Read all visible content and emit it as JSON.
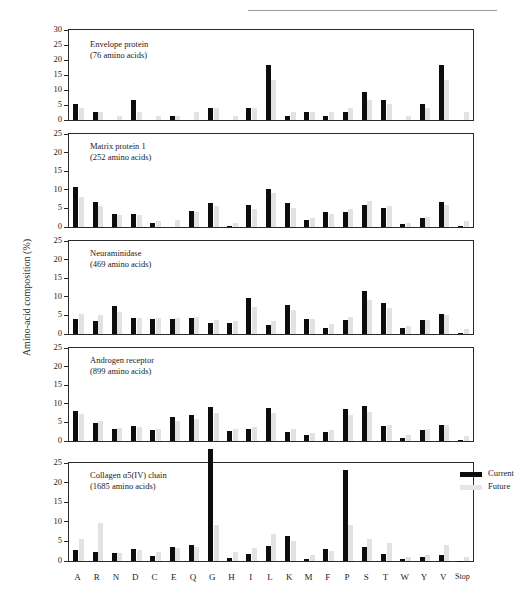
{
  "page": {
    "running_head": "",
    "background": "#ffffff"
  },
  "axis": {
    "ylabel": "Amino-acid composition (%)",
    "ytick_labels_tall": [
      "0",
      "5",
      "10",
      "15",
      "20",
      "25",
      "30"
    ],
    "ytick_labels": [
      "0",
      "5",
      "10",
      "15",
      "20",
      "25"
    ],
    "categories": [
      "A",
      "R",
      "N",
      "D",
      "C",
      "E",
      "Q",
      "G",
      "H",
      "I",
      "L",
      "K",
      "M",
      "F",
      "P",
      "S",
      "T",
      "W",
      "Y",
      "V",
      "Stop"
    ]
  },
  "legend": {
    "position": "top-right-of-bottom-panel",
    "entries": [
      {
        "label": "Current",
        "color": "#0d0d0d"
      },
      {
        "label": "Future",
        "color": "#e6e6e6"
      }
    ]
  },
  "colors": {
    "current": "#0d0d0d",
    "future": "#e2e2e2",
    "axis": "#2a2a2a",
    "text": "#1c1c1c"
  },
  "chart_data": {
    "type": "bar",
    "xlabel": "",
    "ylabel": "Amino-acid composition (%)",
    "categories": [
      "A",
      "R",
      "N",
      "D",
      "C",
      "E",
      "Q",
      "G",
      "H",
      "I",
      "L",
      "K",
      "M",
      "F",
      "P",
      "S",
      "T",
      "W",
      "Y",
      "V",
      "Stop"
    ],
    "legend": [
      "Current",
      "Future"
    ],
    "panels": [
      {
        "name": "Envelope protein",
        "subtitle": "(76 amino acids)",
        "title_line1": "Envelope protein",
        "title_line2": "(76 amino acids)",
        "ylim": [
          0,
          30
        ],
        "yticks": [
          0,
          5,
          10,
          15,
          20,
          25,
          30
        ],
        "series": [
          {
            "name": "Current",
            "values": [
              5.3,
              2.6,
              0.0,
              6.6,
              0.0,
              1.3,
              0.0,
              3.9,
              0.0,
              3.9,
              18.4,
              1.3,
              2.6,
              1.3,
              2.6,
              9.2,
              6.6,
              0.0,
              5.3,
              18.4,
              0.0
            ]
          },
          {
            "name": "Future",
            "values": [
              3.9,
              2.6,
              1.3,
              2.6,
              1.3,
              1.3,
              2.6,
              3.9,
              1.3,
              3.9,
              13.2,
              2.6,
              2.6,
              2.6,
              3.9,
              6.6,
              5.3,
              1.3,
              3.9,
              13.2,
              2.6
            ]
          }
        ]
      },
      {
        "name": "Matrix protein 1",
        "subtitle": "(252 amino acids)",
        "title_line1": "Matrix protein 1",
        "title_line2": "(252 amino acids)",
        "ylim": [
          0,
          25
        ],
        "yticks": [
          0,
          5,
          10,
          15,
          20,
          25
        ],
        "series": [
          {
            "name": "Current",
            "values": [
              10.7,
              6.6,
              3.6,
              3.6,
              1.2,
              0.0,
              4.4,
              6.4,
              0.4,
              5.9,
              10.3,
              6.4,
              2.0,
              4.0,
              4.0,
              6.0,
              5.2,
              0.8,
              2.4,
              6.8,
              0.4
            ]
          },
          {
            "name": "Future",
            "values": [
              8.0,
              5.6,
              3.2,
              3.2,
              1.6,
              2.0,
              4.0,
              5.6,
              1.2,
              4.8,
              9.1,
              5.2,
              2.4,
              3.6,
              4.8,
              7.1,
              5.6,
              1.2,
              2.8,
              6.0,
              1.6
            ]
          }
        ]
      },
      {
        "name": "Neuraminidase",
        "subtitle": "(469 amino acids)",
        "title_line1": "Neuraminidase",
        "title_line2": "(469 amino acids)",
        "ylim": [
          0,
          25
        ],
        "yticks": [
          0,
          5,
          10,
          15,
          20,
          25
        ],
        "series": [
          {
            "name": "Current",
            "values": [
              4.1,
              3.4,
              7.5,
              4.3,
              4.1,
              4.1,
              4.3,
              3.0,
              2.9,
              9.6,
              2.3,
              7.9,
              4.0,
              1.7,
              3.8,
              11.5,
              8.3,
              1.5,
              3.8,
              5.5,
              0.2
            ]
          },
          {
            "name": "Future",
            "values": [
              5.5,
              5.1,
              5.8,
              4.3,
              4.3,
              4.3,
              4.5,
              3.8,
              3.4,
              7.2,
              3.4,
              6.4,
              4.1,
              2.6,
              4.5,
              9.2,
              7.0,
              2.1,
              3.8,
              5.1,
              1.3
            ]
          }
        ]
      },
      {
        "name": "Androgen receptor",
        "subtitle": "(899 amino acids)",
        "title_line1": "Androgen receptor",
        "title_line2": "(899 amino acids)",
        "ylim": [
          0,
          25
        ],
        "yticks": [
          0,
          5,
          10,
          15,
          20,
          25
        ],
        "series": [
          {
            "name": "Current",
            "values": [
              8.0,
              4.9,
              3.1,
              4.0,
              3.0,
              6.4,
              6.9,
              9.1,
              2.8,
              3.3,
              9.0,
              2.5,
              1.6,
              2.3,
              8.7,
              9.4,
              4.0,
              0.8,
              3.0,
              4.3,
              0.2
            ]
          },
          {
            "name": "Future",
            "values": [
              7.2,
              5.3,
              3.5,
              3.8,
              3.2,
              5.4,
              5.9,
              7.6,
              3.3,
              3.8,
              7.6,
              3.2,
              2.1,
              3.0,
              7.0,
              7.8,
              4.4,
              1.6,
              3.3,
              4.3,
              1.3
            ]
          }
        ]
      },
      {
        "name": "Collagen α5(IV) chain",
        "subtitle": "(1685 amino acids)",
        "title_line1": "Collagen α5(IV) chain",
        "title_line2": "(1685 amino acids)",
        "ylim": [
          0,
          25
        ],
        "yticks": [
          0,
          5,
          10,
          15,
          20,
          25
        ],
        "series": [
          {
            "name": "Current",
            "values": [
              2.7,
              2.3,
              2.0,
              3.1,
              1.2,
              3.5,
              4.2,
              28.6,
              0.8,
              1.8,
              3.9,
              6.4,
              0.6,
              3.0,
              23.1,
              3.5,
              1.9,
              0.5,
              0.9,
              1.5,
              0.1
            ]
          },
          {
            "name": "Future",
            "values": [
              5.6,
              9.8,
              2.1,
              2.8,
              2.4,
              3.2,
              3.6,
              9.3,
              2.2,
              3.4,
              6.9,
              5.0,
              1.5,
              2.6,
              9.2,
              5.7,
              4.7,
              1.0,
              1.6,
              4.1,
              1.1
            ]
          }
        ]
      }
    ]
  }
}
